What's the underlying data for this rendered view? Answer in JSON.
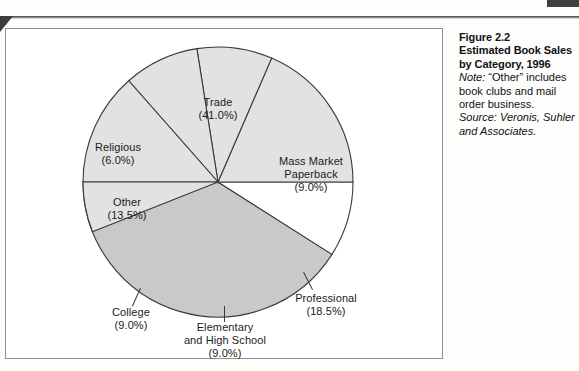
{
  "figure": {
    "title_line1": "Figure 2.2",
    "title_line2": "Estimated Book Sales",
    "title_line3": "by Category, 1996",
    "note_label": "Note:",
    "note_text": " “Other” includes book clubs and mail order business.",
    "source_label": "Source:",
    "source_text": " Veronis, Suhler and Associates."
  },
  "labels": {
    "trade": {
      "name": "Trade",
      "pct": "(41.0%)"
    },
    "religious": {
      "name": "Religious",
      "pct": "(6.0%)"
    },
    "other": {
      "name": "Other",
      "pct": "(13.5%)"
    },
    "college": {
      "name": "College",
      "pct": "(9.0%)"
    },
    "elementary": {
      "name_line1": "Elementary",
      "name_line2": "and High School",
      "pct": "(9.0%)"
    },
    "professional": {
      "name": "Professional",
      "pct": "(18.5%)"
    },
    "massmarket": {
      "name_line1": "Mass Market",
      "name_line2": "Paperback",
      "pct": "(9.0%)"
    }
  },
  "colors": {
    "trade_fill": "#c9c9c9",
    "massmarket_fill": "#ffffff",
    "default_fill": "#e2e2e2",
    "slice_stroke": "#3a3a3a",
    "frame_border": "#8e8e8e",
    "page_background": "#fdfdfc",
    "text": "#1b1b1b"
  },
  "chart_data": {
    "type": "pie",
    "title": "Estimated Book Sales by Category, 1996",
    "subtitle": "",
    "xlabel": "",
    "ylabel": "",
    "legend_position": "none",
    "grid": false,
    "labels_inside": true,
    "units": "percent of total book sales",
    "categories": [
      "Trade",
      "Mass Market Paperback",
      "Professional",
      "Elementary and High School",
      "College",
      "Other",
      "Religious"
    ],
    "values": [
      41.0,
      9.0,
      18.5,
      9.0,
      9.0,
      13.5,
      6.0
    ],
    "slices": [
      {
        "label": "Trade",
        "value": 41.0,
        "display": "(41.0%)",
        "fill": "#c9c9c9"
      },
      {
        "label": "Mass Market Paperback",
        "value": 9.0,
        "display": "(9.0%)",
        "fill": "#ffffff"
      },
      {
        "label": "Professional",
        "value": 18.5,
        "display": "(18.5%)",
        "fill": "#e2e2e2"
      },
      {
        "label": "Elementary and High School",
        "value": 9.0,
        "display": "(9.0%)",
        "fill": "#e2e2e2"
      },
      {
        "label": "College",
        "value": 9.0,
        "display": "(9.0%)",
        "fill": "#e2e2e2"
      },
      {
        "label": "Other",
        "value": 13.5,
        "display": "(13.5%)",
        "fill": "#e2e2e2"
      },
      {
        "label": "Religious",
        "value": 6.0,
        "display": "(6.0%)",
        "fill": "#e2e2e2"
      }
    ],
    "total": 100.0,
    "start_angle_deg": 180,
    "direction": "clockwise"
  }
}
